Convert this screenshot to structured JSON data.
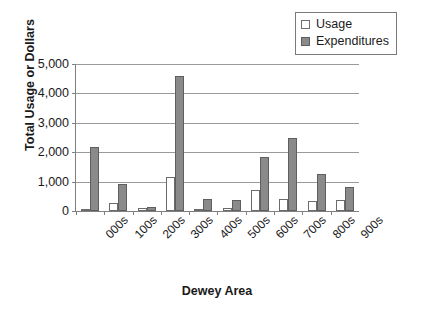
{
  "chart_data": {
    "type": "bar",
    "title": "",
    "xlabel": "Dewey Area",
    "ylabel": "Total Usage or Dollars",
    "categories": [
      "000s",
      "100s",
      "200s",
      "300s",
      "400s",
      "500s",
      "600s",
      "700s",
      "800s",
      "900s"
    ],
    "series": [
      {
        "name": "Usage",
        "values": [
          70,
          270,
          110,
          1150,
          40,
          100,
          720,
          420,
          340,
          390
        ]
      },
      {
        "name": "Expenditures",
        "values": [
          2180,
          930,
          130,
          4600,
          400,
          360,
          1830,
          2470,
          1250,
          820
        ]
      }
    ],
    "ylim": [
      0,
      5000
    ],
    "ytick_labels": [
      "0",
      "1,000",
      "2,000",
      "3,000",
      "4,000",
      "5,000"
    ],
    "ytick_values": [
      0,
      1000,
      2000,
      3000,
      4000,
      5000
    ],
    "grid": true,
    "legend_position": "top-right",
    "colors": {
      "usage_fill": "#ffffff",
      "usage_border": "#6b6b6b",
      "expenditures_fill": "#8a8a8a",
      "expenditures_border": "#5e5e5e",
      "gridline": "#9a9a9a",
      "axis": "#808080",
      "text": "#1a1a1a",
      "background": "#ffffff"
    }
  },
  "legend": {
    "items": [
      {
        "label": "Usage",
        "swatch": "usage-swatch"
      },
      {
        "label": "Expenditures",
        "swatch": "expenditures-swatch"
      }
    ]
  }
}
